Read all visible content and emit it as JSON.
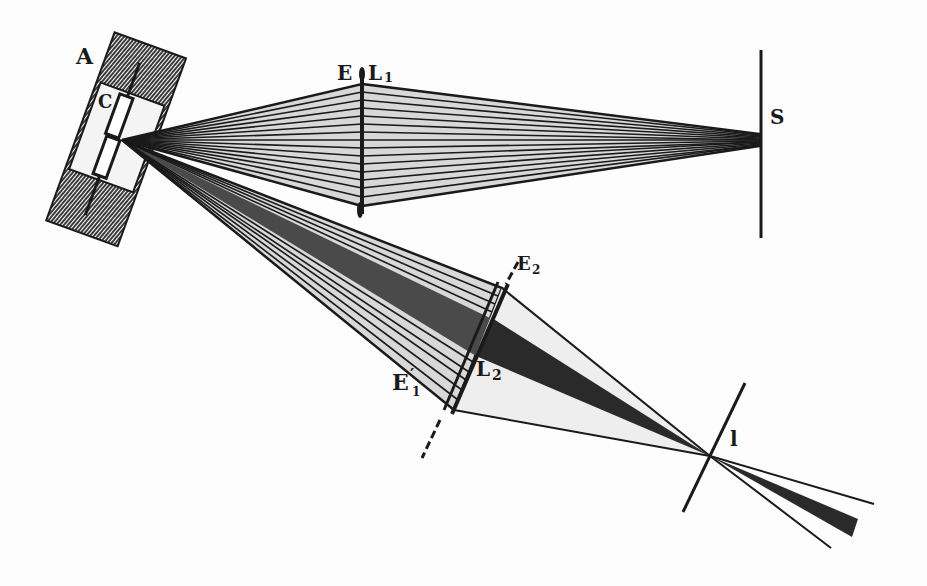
{
  "figure": {
    "colors": {
      "ink": "#1a1a1a",
      "background": "#fdfdfd",
      "hatch": "#555555"
    }
  },
  "labels": {
    "A": "A",
    "C": "C",
    "B": "B",
    "E1": "E",
    "E1_sub": "1",
    "L1": "L",
    "L1_sub": "1",
    "S": "S",
    "E2": "E",
    "E2_sub": "2",
    "E1prime": "E",
    "E1prime_mark": "′",
    "E1prime_sub": "1",
    "L2": "L",
    "L2_sub": "2",
    "l": "l"
  },
  "elements": {
    "source": "arc lamp housing with carbons (A, C)",
    "lens_upper": "L1 with diaphragm E1",
    "screen": "S",
    "lens_lower": "L2 with diaphragms E2 and E'1",
    "focus_point": "l"
  }
}
